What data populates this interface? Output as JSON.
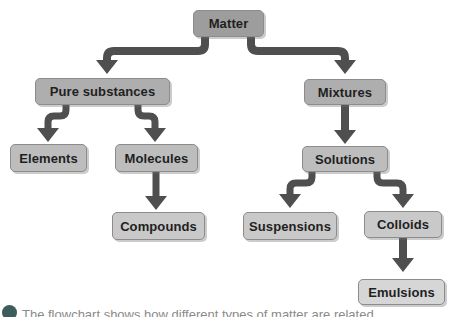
{
  "diagram": {
    "nodes": {
      "matter": {
        "label": "Matter",
        "level": 1
      },
      "pure_substances": {
        "label": "Pure substances",
        "level": 2
      },
      "mixtures": {
        "label": "Mixtures",
        "level": 2
      },
      "elements": {
        "label": "Elements",
        "level": 3
      },
      "molecules": {
        "label": "Molecules",
        "level": 3
      },
      "solutions": {
        "label": "Solutions",
        "level": 3
      },
      "compounds": {
        "label": "Compounds",
        "level": 4
      },
      "suspensions": {
        "label": "Suspensions",
        "level": 4
      },
      "colloids": {
        "label": "Colloids",
        "level": 4
      },
      "emulsions": {
        "label": "Emulsions",
        "level": 5
      }
    },
    "edges": [
      {
        "from": "Matter",
        "to": "Pure substances"
      },
      {
        "from": "Matter",
        "to": "Mixtures"
      },
      {
        "from": "Pure substances",
        "to": "Elements"
      },
      {
        "from": "Pure substances",
        "to": "Molecules"
      },
      {
        "from": "Molecules",
        "to": "Compounds"
      },
      {
        "from": "Mixtures",
        "to": "Solutions"
      },
      {
        "from": "Solutions",
        "to": "Suspensions"
      },
      {
        "from": "Solutions",
        "to": "Colloids"
      },
      {
        "from": "Colloids",
        "to": "Emulsions"
      }
    ]
  },
  "caption": {
    "text": "The flowchart shows how different types of matter are related."
  },
  "colors": {
    "background": "#ffffff",
    "arrow": "#4f4f4f",
    "node_level_1": "#9d9d9d",
    "node_level_2": "#aeaeae",
    "node_level_3": "#bdbdbd",
    "node_level_4": "#c9c9c9",
    "node_level_5": "#d6d6d6",
    "node_border": "#8c8c8c",
    "node_text": "#1f1f1f",
    "caption_bullet": "#3e5c5c"
  }
}
